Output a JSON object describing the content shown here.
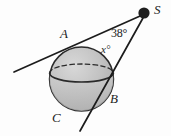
{
  "figure": {
    "kind": "geometry-diagram",
    "background_color": "#fdfdfd",
    "ink_color": "#1c1c1c",
    "sphere_fill": "#b9b9b9",
    "sphere_fill_light": "#d2d2d2",
    "labels": {
      "point_a": "A",
      "point_b": "B",
      "point_c": "C",
      "point_s": "S",
      "angle_at_s": "38°",
      "angle_unknown": "x°"
    },
    "geometry": {
      "circle": {
        "cx": 81.5,
        "cy": 79,
        "r": 32
      },
      "external_point_s": {
        "x": 144,
        "y": 13,
        "dot_r": 5.5
      },
      "tangent_upper": {
        "x1": 14,
        "y1": 72,
        "x2": 143,
        "y2": 15
      },
      "tangent_lower": {
        "x1": 143,
        "y1": 18,
        "x2": 80,
        "y2": 131
      },
      "tangency_point_a": {
        "x": 69,
        "y": 45
      },
      "tangency_point_b": {
        "x": 107,
        "y": 89
      },
      "equator_ellipse": {
        "cx": 81.5,
        "cy": 73,
        "rx": 32,
        "ry": 9
      }
    }
  }
}
